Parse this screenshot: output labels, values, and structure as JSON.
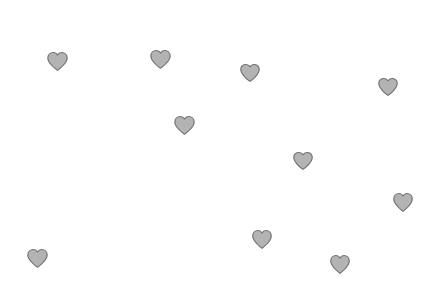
{
  "canvas": {
    "width": 444,
    "height": 297,
    "background_color": "#ffffff",
    "shape_count": 10,
    "shape_type": "heart"
  },
  "style": {
    "fill_color": "#b3b3b3",
    "stroke_color": "#6e6e6e",
    "stroke_width": 1
  },
  "shapes": [
    {
      "name": "heart-1",
      "x": 46,
      "y": 51,
      "width": 23,
      "height": 21,
      "rotation": 0
    },
    {
      "name": "heart-2",
      "x": 149,
      "y": 49,
      "width": 23,
      "height": 21,
      "rotation": 0
    },
    {
      "name": "heart-3",
      "x": 239,
      "y": 63,
      "width": 22,
      "height": 20,
      "rotation": 0
    },
    {
      "name": "heart-4",
      "x": 377,
      "y": 77,
      "width": 22,
      "height": 20,
      "rotation": 0
    },
    {
      "name": "heart-5",
      "x": 173,
      "y": 115,
      "width": 23,
      "height": 21,
      "rotation": 0
    },
    {
      "name": "heart-6",
      "x": 292,
      "y": 151,
      "width": 22,
      "height": 20,
      "rotation": 0
    },
    {
      "name": "heart-7",
      "x": 392,
      "y": 192,
      "width": 22,
      "height": 21,
      "rotation": 0
    },
    {
      "name": "heart-8",
      "x": 251,
      "y": 229,
      "width": 22,
      "height": 21,
      "rotation": 0
    },
    {
      "name": "heart-9",
      "x": 329,
      "y": 254,
      "width": 22,
      "height": 21,
      "rotation": 0
    },
    {
      "name": "heart-10",
      "x": 26,
      "y": 248,
      "width": 23,
      "height": 21,
      "rotation": 0
    }
  ],
  "chart_data": {
    "type": "scatter",
    "title": "",
    "xlabel": "",
    "ylabel": "",
    "marker": "heart",
    "marker_fill": "#b3b3b3",
    "marker_edge": "#6e6e6e",
    "grid": false,
    "legend": null,
    "xlim": [
      0,
      444
    ],
    "ylim": [
      0,
      297
    ],
    "points": [
      {
        "x": 57,
        "y": 62
      },
      {
        "x": 160,
        "y": 60
      },
      {
        "x": 250,
        "y": 73
      },
      {
        "x": 388,
        "y": 87
      },
      {
        "x": 184,
        "y": 126
      },
      {
        "x": 303,
        "y": 161
      },
      {
        "x": 403,
        "y": 203
      },
      {
        "x": 262,
        "y": 240
      },
      {
        "x": 340,
        "y": 265
      },
      {
        "x": 37,
        "y": 259
      }
    ]
  }
}
